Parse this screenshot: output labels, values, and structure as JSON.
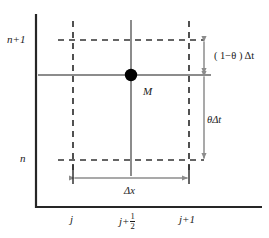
{
  "figure": {
    "kind": "finite-difference-stencil-diagram",
    "colors": {
      "axis": "#262626",
      "gridline": "#8c8c8c",
      "dashed": "#333333",
      "arrow": "#8c8c8c",
      "marker": "#000000",
      "text": "#1a1a1a",
      "background": "#ffffff"
    },
    "axis_labels": {
      "time_upper": "n+1",
      "time_lower": "n",
      "space_left": "j",
      "space_center_base": "j+",
      "space_center_numerator": "1",
      "space_center_denominator": "2",
      "space_right": "j+1"
    },
    "point_label": "M",
    "dimension_labels": {
      "upper_time_step": "( 1−θ ) Δt",
      "lower_time_step": "θΔt",
      "space_step": "Δx"
    },
    "geometry": {
      "axis_x": 36,
      "axis_top": 14,
      "axis_bottom": 207,
      "axis_right": 262,
      "col_left": 73,
      "col_center": 131,
      "col_right": 189,
      "row_upper": 40,
      "row_mid": 75,
      "row_lower": 160,
      "dim_arrow_x": 204,
      "dim_arrow_y": 178,
      "marker_radius": 6
    }
  }
}
